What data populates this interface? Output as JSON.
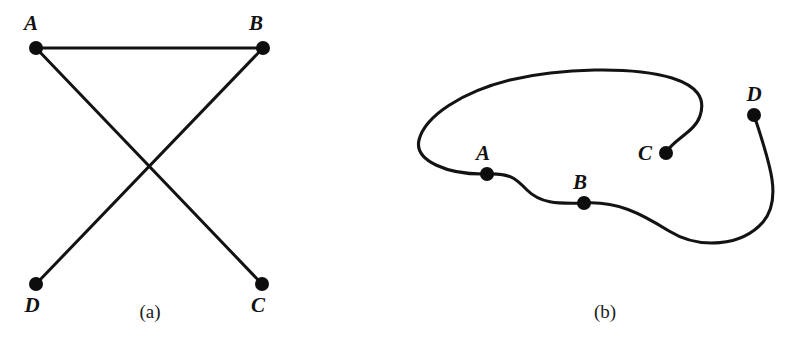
{
  "figure": {
    "background_color": "#ffffff",
    "ink_color": "#131313",
    "panels": [
      {
        "id": "a",
        "caption": "(a)",
        "caption_x": 150,
        "caption_y": 318,
        "kind": "straight-line-drawing",
        "vertices": [
          {
            "name": "A",
            "x": 36,
            "y": 48,
            "r": 7,
            "label": "A",
            "label_x": 31,
            "label_y": 30
          },
          {
            "name": "B",
            "x": 263,
            "y": 48,
            "r": 7,
            "label": "B",
            "label_x": 256,
            "label_y": 30
          },
          {
            "name": "C",
            "x": 262,
            "y": 284,
            "r": 7,
            "label": "C",
            "label_x": 254,
            "label_y": 310
          },
          {
            "name": "D",
            "x": 36,
            "y": 284,
            "r": 7,
            "label": "D",
            "label_x": 28,
            "label_y": 310
          }
        ],
        "edges": [
          {
            "from": "A",
            "to": "B"
          },
          {
            "from": "A",
            "to": "C"
          },
          {
            "from": "B",
            "to": "D"
          }
        ]
      },
      {
        "id": "b",
        "caption": "(b)",
        "caption_x": 605,
        "caption_y": 318,
        "kind": "curved-drawing",
        "vertices": [
          {
            "name": "A",
            "x": 487,
            "y": 174,
            "r": 7,
            "label": "A",
            "label_x": 479,
            "label_y": 157
          },
          {
            "name": "B",
            "x": 584,
            "y": 203,
            "r": 7,
            "label": "B",
            "label_x": 576,
            "label_y": 186
          },
          {
            "name": "C",
            "x": 666,
            "y": 153,
            "r": 7,
            "label": "C",
            "label_x": 641,
            "label_y": 156
          },
          {
            "name": "D",
            "x": 754,
            "y": 115,
            "r": 7,
            "label": "D",
            "label_x": 748,
            "label_y": 99
          }
        ],
        "curve_path": "M 666 153 C 672 140 695 132 700 116 C 706 98 697 86 672 78 C 632 66 560 68 510 80 C 462 92 425 116 419 140 C 414 161 448 175 487 174 C 511 173 516 179 527 190 C 540 203 556 204 584 203 C 617 201 640 213 669 231 C 700 250 742 246 763 222 C 782 200 771 166 754 115",
        "path_description": "single continuous curve from C around the top-left loop, through A and B, sweeping bottom-right and up to D"
      }
    ]
  }
}
